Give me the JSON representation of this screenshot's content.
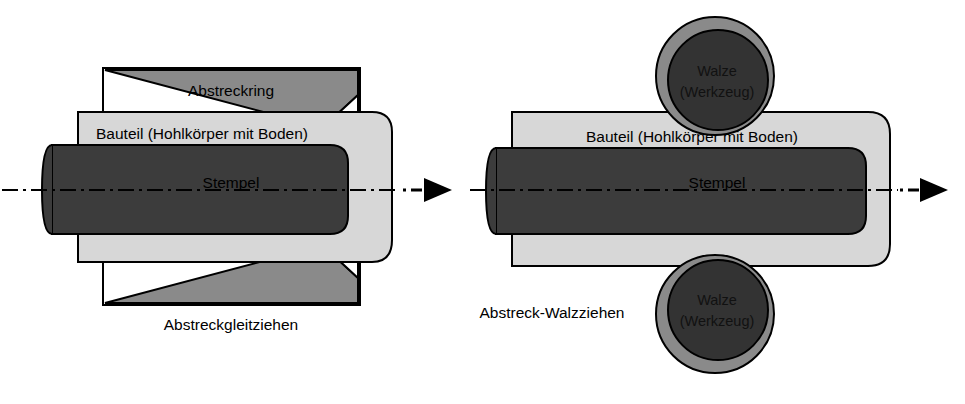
{
  "figure": {
    "background_color": "#ffffff",
    "outline_color": "#000000",
    "colors": {
      "workpiece_light_gray": "#d7d7d7",
      "tool_medium_gray": "#8a8a8a",
      "punch_dark_gray": "#3c3c3c",
      "roller_core_dark": "#333333",
      "centerline": "#000000",
      "text": "#000000"
    }
  },
  "left_process": {
    "caption": "Abstreckgleitziehen",
    "labels": {
      "die": "Abstreckring",
      "workpiece": "Bauteil (Hohlkörper mit Boden)",
      "punch": "Stempel"
    }
  },
  "right_process": {
    "caption": "Abstreck-Walzziehen",
    "labels": {
      "workpiece": "Bauteil (Hohlkörper mit Boden)",
      "punch": "Stempel",
      "roller_line1": "Walze",
      "roller_line2": "(Werkzeug)"
    }
  },
  "annotations": {
    "centerline_style": "dash-dot",
    "arrow_middle": "arrow-right-solid-triangle",
    "arrow_right": "arrow-right-solid-triangle"
  }
}
